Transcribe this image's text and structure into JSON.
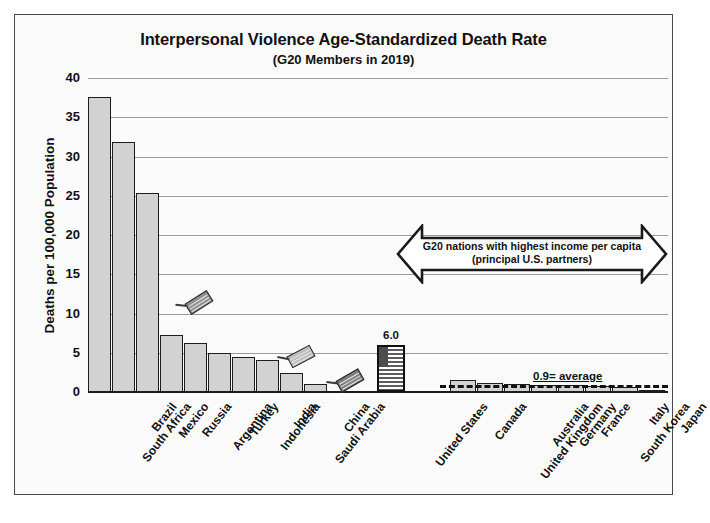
{
  "chart_data": {
    "type": "bar",
    "title": "Interpersonal Violence Age-Standardized Death Rate",
    "subtitle": "(G20 Members in 2019)",
    "xlabel": "",
    "ylabel": "Deaths per 100,000 Population",
    "ylim": [
      0,
      40
    ],
    "yticks": [
      0,
      5,
      10,
      15,
      20,
      25,
      30,
      35,
      40
    ],
    "ytick_labels": [
      "0",
      "5",
      "10",
      "15",
      "20",
      "25",
      "30",
      "35",
      "40"
    ],
    "grid": true,
    "legend": "none",
    "categories": [
      "South Africa",
      "Brazil",
      "Mexico",
      "Russia",
      "Argentina",
      "Turkey",
      "Indonesia",
      "India",
      "Saudi Arabia",
      "China",
      "United States",
      "Canada",
      "United Kingdom",
      "Australia",
      "Germany",
      "France",
      "South Korea",
      "Italy",
      "Japan"
    ],
    "values": [
      37.6,
      31.8,
      25.4,
      7.3,
      6.3,
      5.0,
      4.5,
      4.1,
      2.4,
      1.0,
      6.0,
      1.5,
      1.2,
      1.0,
      0.9,
      0.9,
      0.8,
      0.6,
      0.2
    ],
    "highlight_bar": "United States",
    "highlight_value_label": "6.0",
    "annotations": [
      {
        "name": "income-arrow",
        "text_line1": "G20 nations with highest income per capita",
        "text_line2": "(principal U.S. partners)",
        "covers": [
          "United States",
          "Canada",
          "United Kingdom",
          "Australia",
          "Germany",
          "France",
          "South Korea",
          "Italy",
          "Japan"
        ]
      },
      {
        "name": "average-line",
        "label": "0.9= average",
        "value": 0.9
      }
    ],
    "marker_labels": [
      "russia-flag-marker",
      "india-flag-marker",
      "china-flag-marker"
    ],
    "colors": {
      "bar_fill": "#d2d2d2",
      "bar_edge": "#1d1d1d",
      "gridline": "#9a9a9a",
      "axis": "#1a1a1a",
      "text": "#111111",
      "background": "#fbfbfb",
      "frame": "#4a4a4a"
    }
  }
}
